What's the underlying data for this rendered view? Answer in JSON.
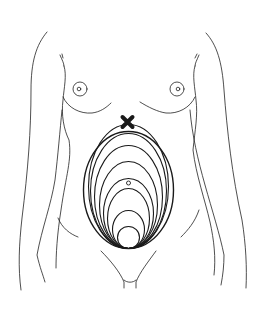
{
  "figure": {
    "colors": {
      "stroke": "#222222",
      "marker": "#1a1a1a",
      "background": "#ffffff"
    },
    "markers": [
      {
        "name": "fundus-max-marker",
        "icon": "cross-mark-icon",
        "meaning": "maximum fundal height below xiphoid"
      },
      {
        "name": "umbilicus-marker",
        "icon": "small-circle-icon",
        "meaning": "umbilicus"
      }
    ],
    "uterus_stage_count": 9
  }
}
